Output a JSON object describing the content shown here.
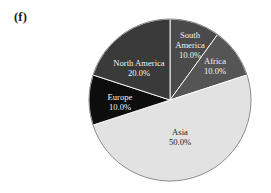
{
  "figure": {
    "panel_letter": "(f)",
    "background_color": "#ffffff"
  },
  "chart_data": {
    "type": "pie",
    "title": "",
    "subtitle": "",
    "xlabel": "",
    "ylabel": "",
    "grid": false,
    "legend_position": "none",
    "labels_inside_slices": true,
    "start_angle_deg": 0,
    "direction": "clockwise",
    "units": "percent",
    "center": {
      "x": 170,
      "y": 100
    },
    "radius": 81,
    "categories": [
      "South America",
      "Africa",
      "Asia",
      "Europe",
      "North America"
    ],
    "values": [
      10.0,
      10.0,
      50.0,
      10.0,
      20.0
    ],
    "value_labels": [
      "10.0%",
      "10.0%",
      "50.0%",
      "10.0%",
      "20.0%"
    ],
    "colors": [
      "#4a4a4a",
      "#555555",
      "#e2e2e2",
      "#0d0d0d",
      "#3a3a3a"
    ],
    "slices": [
      {
        "name": "South America",
        "value": 10.0,
        "value_label": "10.0%",
        "color": "#4a4a4a",
        "text_color": "#f2f2f2",
        "start_deg": 0,
        "end_deg": 36,
        "label_lines": [
          "South",
          "America",
          "10.0%"
        ],
        "label_x": 190,
        "label_y": 38
      },
      {
        "name": "Africa",
        "value": 10.0,
        "value_label": "10.0%",
        "color": "#555555",
        "text_color": "#f2f2f2",
        "start_deg": 36,
        "end_deg": 72,
        "label_lines": [
          "Africa",
          "10.0%"
        ],
        "label_x": 215,
        "label_y": 64
      },
      {
        "name": "Asia",
        "value": 50.0,
        "value_label": "50.0%",
        "color": "#e2e2e2",
        "text_color": "#1a1a1a",
        "start_deg": 72,
        "end_deg": 252,
        "label_lines": [
          "Asia",
          "50.0%"
        ],
        "label_x": 180,
        "label_y": 135
      },
      {
        "name": "Europe",
        "value": 10.0,
        "value_label": "10.0%",
        "color": "#0d0d0d",
        "text_color": "#f2f2f2",
        "start_deg": 252,
        "end_deg": 288,
        "label_lines": [
          "Europe",
          "10.0%"
        ],
        "label_x": 120,
        "label_y": 100
      },
      {
        "name": "North America",
        "value": 20.0,
        "value_label": "20.0%",
        "color": "#3a3a3a",
        "text_color": "#f2f2f2",
        "start_deg": 288,
        "end_deg": 360,
        "label_lines": [
          "North America",
          "20.0%"
        ],
        "label_x": 139,
        "label_y": 66
      }
    ]
  }
}
